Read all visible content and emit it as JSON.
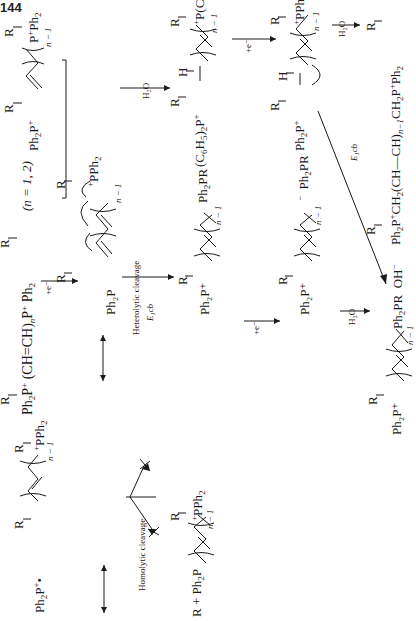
{
  "page": {
    "number": "144"
  },
  "scheme": {
    "start": {
      "formula": "Ph₂P⁺ (CH=CH)ₙP⁺ Ph₂",
      "left_group": "Ph",
      "left_sub": "2",
      "p1": "P",
      "p1_charge": "+",
      "chain": "(CH",
      "chain_mid": "CH)",
      "chain_sub": "n",
      "p2": "P",
      "p2_charge": "+",
      "right_group": "Ph",
      "right_sub": "2",
      "r1": "R",
      "r2": "R",
      "condition": "(n = 1, 2)"
    },
    "step1_reagent": "+e⁻",
    "radical_center": {
      "left": "Ph₂P",
      "right": "PPh₂",
      "r": "R",
      "n_label": "n − 1",
      "charge": "+"
    },
    "radical_top": {
      "left": "Ph₂P⁺",
      "right": "P⁺Ph₂",
      "r": "R",
      "n_label": "n − 1"
    },
    "radical_bottom": {
      "left": "Ph₂P⁺",
      "right": "PPh₂",
      "r": "R",
      "n_label": "n − 1"
    },
    "homolytic": {
      "label": "Homolytic cleavage",
      "product_left": "R + Ph₂P",
      "product_right": "PPh₂",
      "r": "R",
      "n_label": "n − 1"
    },
    "heterolytic": {
      "label": "Heterolytic cleavage",
      "sublabel": "E₁cb",
      "product_left": "Ph₂P⁺",
      "product_right": "Ph₂PR",
      "r": "R",
      "n_label": "n − 1"
    },
    "hydration_radical": {
      "reagent": "H₂O",
      "left": "(C₆H₅)₂P⁺",
      "right": "P(C₆H₅)₂",
      "h": "H",
      "r": "R",
      "n_label": "n − 1"
    },
    "reduction_anion": {
      "reagent": "+e⁻",
      "left": "Ph₂P⁺",
      "right": "PPh₂",
      "h": "H",
      "r": "R",
      "n_label": "n − 1"
    },
    "anion_from_heterolytic": {
      "reagent": "+e⁻",
      "left": "Ph₂P⁺",
      "right": "Ph₂PR",
      "r": "R",
      "n_label": "n − 1"
    },
    "final_saturated": {
      "reagent": "H₂O",
      "formula": "Ph₂P⁺CH₂(CH—CH)ₙ₋₁CH₂P⁺Ph₂",
      "r1": "R",
      "r2": "R"
    },
    "final_ylide": {
      "reagent_h2o": "H₂O",
      "reagent_e1cb": "E₁cb",
      "left": "Ph₂P⁺",
      "right": "Ph₂PR  OH⁻",
      "r": "R",
      "n_label": "n − 1"
    }
  }
}
